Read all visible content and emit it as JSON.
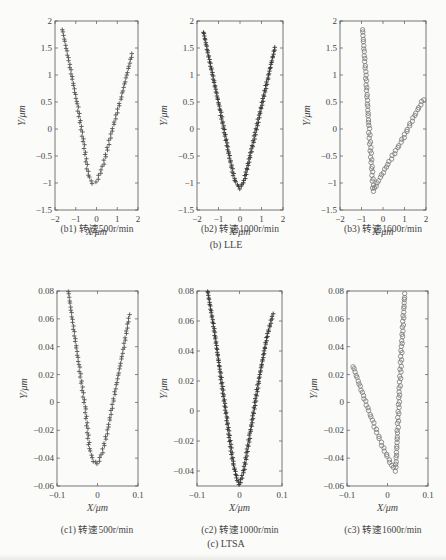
{
  "figure": {
    "groups": [
      {
        "id": "b",
        "caption": "(b) LLE"
      },
      {
        "id": "c",
        "caption": "(c) LTSA"
      }
    ]
  },
  "chart_data": [
    {
      "id": "b1",
      "type": "scatter",
      "caption": "(b1) 转速500r/min",
      "xlabel": "X/μm",
      "ylabel": "Y/μm",
      "xlim": [
        -2,
        2
      ],
      "ylim": [
        -1.5,
        2
      ],
      "xticks": [
        "-2",
        "-1",
        "0",
        "1",
        "2"
      ],
      "yticks": [
        "-1.5",
        "-1",
        "-0.5",
        "0",
        "0.5",
        "1",
        "1.5",
        "2"
      ],
      "marker": "+",
      "color": "#555555",
      "points": [
        [
          -1.65,
          1.85
        ],
        [
          -1.3,
          1.2
        ],
        [
          -0.9,
          0.4
        ],
        [
          -0.6,
          -0.3
        ],
        [
          -0.4,
          -0.85
        ],
        [
          -0.2,
          -1.0
        ],
        [
          0.0,
          -0.98
        ],
        [
          0.3,
          -0.7
        ],
        [
          0.7,
          -0.1
        ],
        [
          1.2,
          0.6
        ],
        [
          1.75,
          1.45
        ]
      ]
    },
    {
      "id": "b2",
      "type": "scatter",
      "caption": "(b2) 转速1000r/min",
      "xlabel": "X/μm",
      "ylabel": "Y/μm",
      "xlim": [
        -2,
        2
      ],
      "ylim": [
        -1.5,
        2
      ],
      "xticks": [
        "-2",
        "-1",
        "0",
        "1",
        "2"
      ],
      "yticks": [
        "-1.5",
        "-1",
        "-0.5",
        "0",
        "0.5",
        "1",
        "1.5",
        "2"
      ],
      "marker": "+",
      "color": "#333333",
      "points": [
        [
          -1.7,
          1.8
        ],
        [
          -1.3,
          1.05
        ],
        [
          -0.9,
          0.3
        ],
        [
          -0.5,
          -0.5
        ],
        [
          -0.25,
          -0.95
        ],
        [
          0.0,
          -1.1
        ],
        [
          0.2,
          -0.95
        ],
        [
          0.5,
          -0.45
        ],
        [
          0.9,
          0.25
        ],
        [
          1.3,
          0.95
        ],
        [
          1.65,
          1.55
        ]
      ]
    },
    {
      "id": "b3",
      "type": "scatter",
      "caption": "(b3) 转速1600r/min",
      "xlabel": "X/μm",
      "ylabel": "Y/μm",
      "xlim": [
        -2,
        2
      ],
      "ylim": [
        -1.5,
        2
      ],
      "xticks": [
        "-2",
        "-1",
        "0",
        "1",
        "2"
      ],
      "yticks": [
        "-1.5",
        "-1",
        "-0.5",
        "0",
        "0.5",
        "1",
        "1.5",
        "2"
      ],
      "marker": "o",
      "color": "#777777",
      "points": [
        [
          -0.95,
          1.85
        ],
        [
          -0.8,
          1.0
        ],
        [
          -0.65,
          0.0
        ],
        [
          -0.5,
          -0.8
        ],
        [
          -0.45,
          -1.15
        ],
        [
          -0.2,
          -0.95
        ],
        [
          0.3,
          -0.6
        ],
        [
          0.9,
          -0.2
        ],
        [
          1.4,
          0.2
        ],
        [
          1.95,
          0.6
        ]
      ]
    },
    {
      "id": "c1",
      "type": "scatter",
      "caption": "(c1) 转速500r/min",
      "xlabel": "X/μm",
      "ylabel": "Y/μm",
      "xlim": [
        -0.1,
        0.1
      ],
      "ylim": [
        -0.06,
        0.08
      ],
      "xticks": [
        "-0.1",
        "0",
        "0.1"
      ],
      "yticks": [
        "-0.06",
        "-0.04",
        "-0.02",
        "0",
        "0.02",
        "0.04",
        "0.06",
        "0.08"
      ],
      "marker": "+",
      "color": "#555555",
      "points": [
        [
          -0.072,
          0.08
        ],
        [
          -0.06,
          0.055
        ],
        [
          -0.045,
          0.025
        ],
        [
          -0.03,
          -0.005
        ],
        [
          -0.02,
          -0.033
        ],
        [
          -0.01,
          -0.042
        ],
        [
          0.0,
          -0.044
        ],
        [
          0.01,
          -0.038
        ],
        [
          0.025,
          -0.02
        ],
        [
          0.045,
          0.01
        ],
        [
          0.065,
          0.04
        ],
        [
          0.08,
          0.065
        ]
      ]
    },
    {
      "id": "c2",
      "type": "scatter",
      "caption": "(c2) 转速1000r/min",
      "xlabel": "X/μm",
      "ylabel": "Y/μm",
      "xlim": [
        -0.1,
        0.1
      ],
      "ylim": [
        -0.05,
        0.08
      ],
      "xticks": [
        "-0.1",
        "0",
        "0.1"
      ],
      "yticks": [
        "-0.04",
        "-0.02",
        "0",
        "0.02",
        "0.04",
        "0.06",
        "0.08"
      ],
      "marker": "+",
      "color": "#333333",
      "points": [
        [
          -0.075,
          0.08
        ],
        [
          -0.06,
          0.055
        ],
        [
          -0.045,
          0.025
        ],
        [
          -0.03,
          -0.005
        ],
        [
          -0.015,
          -0.035
        ],
        [
          -0.005,
          -0.046
        ],
        [
          0.0,
          -0.049
        ],
        [
          0.01,
          -0.04
        ],
        [
          0.025,
          -0.015
        ],
        [
          0.045,
          0.02
        ],
        [
          0.065,
          0.05
        ],
        [
          0.08,
          0.066
        ]
      ]
    },
    {
      "id": "c3",
      "type": "scatter",
      "caption": "(c3) 转速1600r/min",
      "xlabel": "X/μm",
      "ylabel": "Y/μm",
      "xlim": [
        -0.1,
        0.1
      ],
      "ylim": [
        -0.06,
        0.08
      ],
      "xticks": [
        "-0.1",
        "0",
        "0.1"
      ],
      "yticks": [
        "-0.06",
        "-0.04",
        "-0.02",
        "0",
        "0.02",
        "0.04",
        "0.06",
        "0.08"
      ],
      "marker": "o",
      "color": "#777777",
      "points": [
        [
          -0.085,
          0.026
        ],
        [
          -0.06,
          0.005
        ],
        [
          -0.035,
          -0.015
        ],
        [
          -0.01,
          -0.033
        ],
        [
          0.01,
          -0.045
        ],
        [
          0.02,
          -0.049
        ],
        [
          0.025,
          -0.02
        ],
        [
          0.03,
          0.01
        ],
        [
          0.035,
          0.04
        ],
        [
          0.04,
          0.065
        ],
        [
          0.043,
          0.08
        ]
      ]
    }
  ]
}
